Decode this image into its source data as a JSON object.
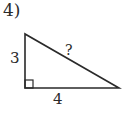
{
  "problem": {
    "number": "4)"
  },
  "triangle": {
    "type": "right-triangle",
    "vertices": {
      "top": [
        25,
        34
      ],
      "right_angle": [
        25,
        88
      ],
      "right": [
        119,
        88
      ]
    },
    "labels": {
      "vertical_leg": "3",
      "horizontal_leg": "4",
      "hypotenuse": "?"
    },
    "right_angle_marker": true,
    "stroke_color": "#2a2a2a"
  }
}
